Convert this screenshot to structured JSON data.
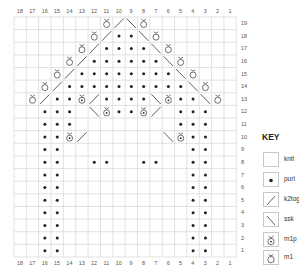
{
  "chart_data": {
    "type": "table",
    "columns": 18,
    "rows": 19,
    "column_labels_top": [
      "18",
      "17",
      "16",
      "15",
      "14",
      "13",
      "12",
      "11",
      "10",
      "9",
      "8",
      "7",
      "6",
      "5",
      "4",
      "3",
      "2",
      "1"
    ],
    "column_labels_bottom": [
      "18",
      "17",
      "16",
      "15",
      "14",
      "13",
      "12",
      "11",
      "10",
      "9",
      "8",
      "7",
      "6",
      "5",
      "4",
      "3",
      "2",
      "1"
    ],
    "row_labels_right": [
      "19",
      "18",
      "17",
      "16",
      "15",
      "14",
      "13",
      "12",
      "11",
      "10",
      "9",
      "8",
      "7",
      "6",
      "5",
      "4",
      "3",
      "2",
      "1"
    ],
    "legend": [
      {
        "symbol": "knit",
        "label": "knit"
      },
      {
        "symbol": "purl",
        "label": "purl"
      },
      {
        "symbol": "k2tog",
        "label": "k2tog"
      },
      {
        "symbol": "ssk",
        "label": "ssk"
      },
      {
        "symbol": "m1p",
        "label": "m1p"
      },
      {
        "symbol": "m1",
        "label": "m1"
      }
    ],
    "grid_note": "rows listed top (row 19) to bottom (row 1); each row string lists columns 18 → 1; K=knit(blank) P=purl M=m1 Q=m1p /=k2tog \\=ssk",
    "grid": [
      "KKKKKKKM/\\MKKKKKKK",
      "KKKKKKM/PP\\MKKKKKK",
      "KKKKKM/PPPP\\MKKKKK",
      "KKKKM/PPPPPP\\MKKKK",
      "KKKM/PPPPPPPP\\MKKK",
      "KKM/PPPPPPPPPP\\MKK",
      "KM/PPQ/PPPP\\QPP\\MK",
      "KKPPPK\\QPPQ/KPPPKK",
      "KKPPPKKKKKKKKPPPKK",
      "KKPPQ/KKKKKK\\QPPKK",
      "KKPPKKKKKKKKKKPPKK",
      "KKPPKKPPKKPPKKPPKK",
      "KKPPKKKKKKKKKKPPKK",
      "KKPPKKKKKKKKKKPPKK",
      "KKPPKKKKKKKKKKPPKK",
      "KKPPKKKKKKKKKKPPKK",
      "KKPPKKKKKKKKKKPPKK",
      "KKPPKKKKKKKKKKPPKK",
      "KKPPKKKKKKKKKKPPKK"
    ]
  },
  "key": {
    "title": "KEY",
    "items": [
      {
        "symbol": "knit",
        "label": "knit"
      },
      {
        "symbol": "purl",
        "label": "purl"
      },
      {
        "symbol": "k2tog",
        "label": "k2tog"
      },
      {
        "symbol": "ssk",
        "label": "ssk"
      },
      {
        "symbol": "m1p",
        "label": "m1p"
      },
      {
        "symbol": "m1",
        "label": "m1"
      }
    ]
  },
  "colors": {
    "grid_line": "#cfcfcf",
    "symbol": "#222222",
    "label": "#555555"
  }
}
